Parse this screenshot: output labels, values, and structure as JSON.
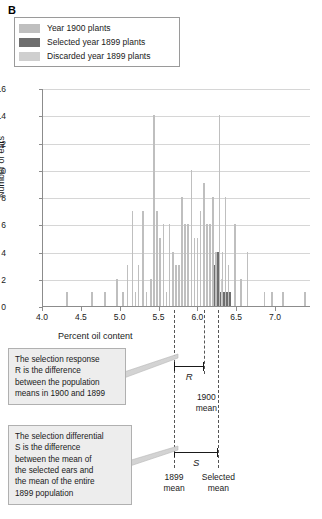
{
  "panel": {
    "letter": "B"
  },
  "legend": {
    "items": [
      {
        "label": "Year 1900 plants",
        "color": "#bfbfbf",
        "key": "year1900"
      },
      {
        "label": "Selected year 1899 plants",
        "color": "#6e6e6e",
        "key": "selected1899"
      },
      {
        "label": "Discarded year 1899 plants",
        "color": "#cfcfcf",
        "key": "discarded1899"
      }
    ]
  },
  "chart_data": {
    "type": "bar",
    "title": "",
    "xlabel": "Percent oil content",
    "ylabel": "Number of ears",
    "xlim": [
      4.0,
      7.45
    ],
    "ylim": [
      0,
      16
    ],
    "ytick_step": 2,
    "yticks": [
      0,
      2,
      4,
      6,
      8,
      10,
      12,
      14,
      16
    ],
    "xticks": [
      4.0,
      4.5,
      5.0,
      5.5,
      6.0,
      6.5,
      7.0
    ],
    "xtick_labels": [
      "4.0",
      "4.5",
      "5.0",
      "5.5",
      "6.0",
      "6.5",
      "7.0"
    ],
    "grid": true,
    "bar_width": 0.018,
    "series": [
      {
        "name": "Year 1900 plants",
        "color": "#bfbfbf"
      },
      {
        "name": "Selected year 1899 plants",
        "color": "#6e6e6e"
      },
      {
        "name": "Discarded year 1899 plants",
        "color": "#cfcfcf"
      }
    ],
    "bars": [
      {
        "x": 4.31,
        "y": 1,
        "series": 0
      },
      {
        "x": 4.63,
        "y": 1,
        "series": 0
      },
      {
        "x": 4.8,
        "y": 1,
        "series": 0
      },
      {
        "x": 4.95,
        "y": 2,
        "series": 0
      },
      {
        "x": 5.03,
        "y": 1,
        "series": 0
      },
      {
        "x": 5.09,
        "y": 3,
        "series": 0
      },
      {
        "x": 5.15,
        "y": 7,
        "series": 0
      },
      {
        "x": 5.19,
        "y": 1,
        "series": 0
      },
      {
        "x": 5.23,
        "y": 3,
        "series": 0
      },
      {
        "x": 5.29,
        "y": 7,
        "series": 0
      },
      {
        "x": 5.33,
        "y": 1,
        "series": 0
      },
      {
        "x": 5.39,
        "y": 2,
        "series": 0
      },
      {
        "x": 5.43,
        "y": 14,
        "series": 0
      },
      {
        "x": 5.47,
        "y": 7,
        "series": 0
      },
      {
        "x": 5.51,
        "y": 5,
        "series": 0
      },
      {
        "x": 5.55,
        "y": 6,
        "series": 0
      },
      {
        "x": 5.59,
        "y": 1,
        "series": 0
      },
      {
        "x": 5.63,
        "y": 6,
        "series": 0
      },
      {
        "x": 5.67,
        "y": 4,
        "series": 0
      },
      {
        "x": 5.71,
        "y": 3,
        "series": 0
      },
      {
        "x": 5.75,
        "y": 3,
        "series": 0
      },
      {
        "x": 5.79,
        "y": 8,
        "series": 0
      },
      {
        "x": 5.83,
        "y": 6,
        "series": 0
      },
      {
        "x": 5.87,
        "y": 6,
        "series": 0
      },
      {
        "x": 5.91,
        "y": 10,
        "series": 0
      },
      {
        "x": 5.95,
        "y": 5,
        "series": 0
      },
      {
        "x": 5.99,
        "y": 5,
        "series": 0
      },
      {
        "x": 6.03,
        "y": 7,
        "series": 0
      },
      {
        "x": 6.07,
        "y": 9,
        "series": 0
      },
      {
        "x": 6.11,
        "y": 6,
        "series": 0
      },
      {
        "x": 6.15,
        "y": 6,
        "series": 0
      },
      {
        "x": 6.19,
        "y": 8,
        "series": 0
      },
      {
        "x": 6.23,
        "y": 4,
        "series": 0
      },
      {
        "x": 6.27,
        "y": 14,
        "series": 0
      },
      {
        "x": 6.31,
        "y": 4,
        "series": 0
      },
      {
        "x": 6.35,
        "y": 8,
        "series": 0
      },
      {
        "x": 6.39,
        "y": 3,
        "series": 0
      },
      {
        "x": 6.47,
        "y": 6,
        "series": 0
      },
      {
        "x": 6.55,
        "y": 2,
        "series": 0
      },
      {
        "x": 6.63,
        "y": 4,
        "series": 0
      },
      {
        "x": 6.85,
        "y": 1,
        "series": 0
      },
      {
        "x": 6.95,
        "y": 1,
        "series": 0
      },
      {
        "x": 7.09,
        "y": 1,
        "series": 0
      },
      {
        "x": 7.37,
        "y": 1,
        "series": 0
      },
      {
        "x": 6.21,
        "y": 3,
        "series": 1
      },
      {
        "x": 6.25,
        "y": 4,
        "series": 1
      },
      {
        "x": 6.29,
        "y": 1,
        "series": 1
      },
      {
        "x": 6.33,
        "y": 1,
        "series": 1
      },
      {
        "x": 6.37,
        "y": 1,
        "series": 1
      },
      {
        "x": 6.41,
        "y": 1,
        "series": 1
      },
      {
        "x": 6.3,
        "y": 2,
        "series": 2
      }
    ]
  },
  "means": {
    "mean_1899": {
      "x": 5.7,
      "label_line1": "1899",
      "label_line2": "mean"
    },
    "mean_1900": {
      "x": 6.09,
      "label_line1": "1900",
      "label_line2": "mean"
    },
    "mean_selected": {
      "x": 6.27,
      "label_line1": "Selected",
      "label_line2": "mean"
    }
  },
  "brackets": {
    "R": {
      "symbol": "R",
      "from": 5.7,
      "to": 6.09
    },
    "S": {
      "symbol": "S",
      "from": 5.7,
      "to": 6.27
    }
  },
  "callouts": [
    {
      "id": "selection-response",
      "lines": [
        "The selection response",
        "R is the difference",
        "between the population",
        "means in 1900 and 1899"
      ],
      "text": "The selection response R is the difference between the population means in 1900 and 1899"
    },
    {
      "id": "selection-differential",
      "lines": [
        "The selection differential",
        "S is the difference",
        "between the mean of",
        "the selected ears and",
        "the mean of the entire",
        "1899 population"
      ],
      "text": "The selection differential S is the difference between the mean of the selected ears and the mean of the entire 1899 population"
    }
  ]
}
